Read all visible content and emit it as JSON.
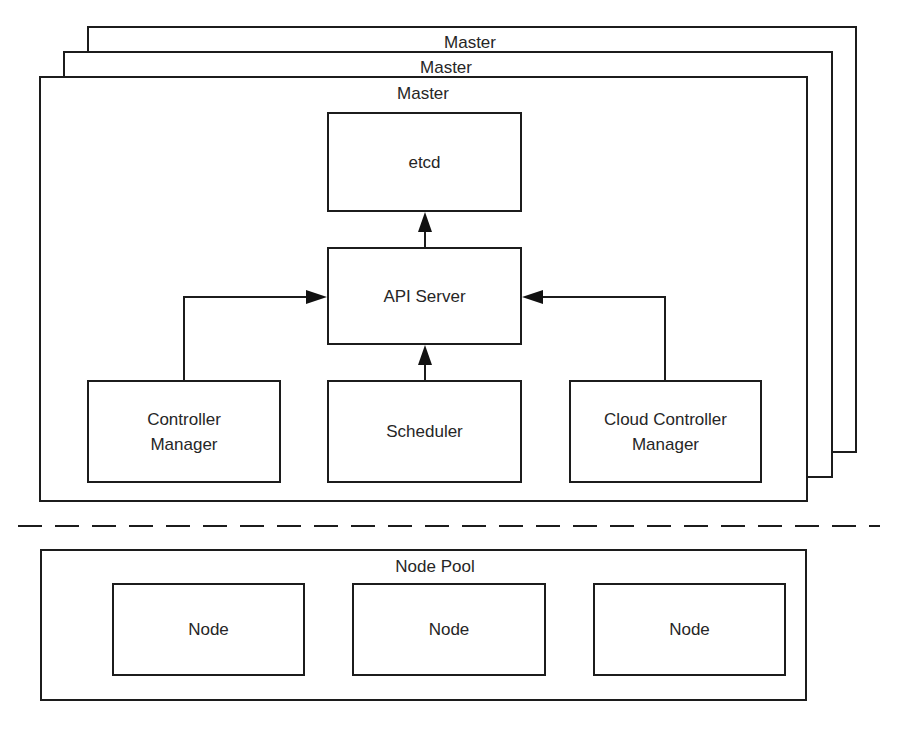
{
  "diagram": {
    "masters": [
      {
        "label": "Master"
      },
      {
        "label": "Master"
      },
      {
        "label": "Master"
      }
    ],
    "components": {
      "etcd": {
        "label": "etcd"
      },
      "api_server": {
        "label": "API Server"
      },
      "controller_manager": {
        "line1": "Controller",
        "line2": "Manager"
      },
      "scheduler": {
        "label": "Scheduler"
      },
      "cloud_controller_manager": {
        "line1": "Cloud Controller",
        "line2": "Manager"
      }
    },
    "node_pool": {
      "label": "Node Pool",
      "nodes": [
        {
          "label": "Node"
        },
        {
          "label": "Node"
        },
        {
          "label": "Node"
        }
      ]
    },
    "connections": [
      {
        "from": "API Server",
        "to": "etcd"
      },
      {
        "from": "Controller Manager",
        "to": "API Server"
      },
      {
        "from": "Scheduler",
        "to": "API Server"
      },
      {
        "from": "Cloud Controller Manager",
        "to": "API Server"
      }
    ]
  }
}
